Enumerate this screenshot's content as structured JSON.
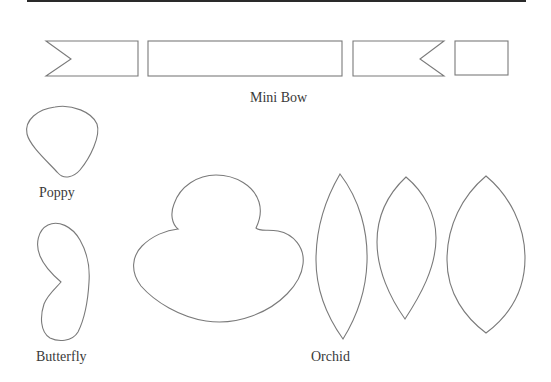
{
  "document": {
    "stroke_color": "#7a7a7a",
    "rule_color": "#2a2a2a",
    "background": "#ffffff"
  },
  "templates": {
    "mini_bow": {
      "label": "Mini Bow",
      "pieces": [
        "notched-left-strip",
        "long-strip",
        "notched-right-strip",
        "small-square"
      ]
    },
    "poppy": {
      "label": "Poppy",
      "pieces": [
        "poppy-petal"
      ]
    },
    "butterfly": {
      "label": "Butterfly",
      "pieces": [
        "butterfly-wing"
      ]
    },
    "orchid": {
      "label": "Orchid",
      "pieces": [
        "orchid-lip",
        "orchid-petal-narrow",
        "orchid-petal-medium",
        "orchid-petal-wide"
      ]
    }
  }
}
